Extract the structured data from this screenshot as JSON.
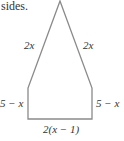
{
  "caption_fragment": "sides.",
  "figure": {
    "shape": "pentagon (triangle atop rectangle)",
    "stroke_color": "#8a8a8a",
    "vertices": [
      [
        60,
        1
      ],
      [
        28,
        88
      ],
      [
        28,
        119
      ],
      [
        92,
        119
      ],
      [
        92,
        88
      ]
    ],
    "labels": {
      "left_slant": "2x",
      "right_slant": "2x",
      "left_vertical": "5 − x",
      "right_vertical": "5 − x",
      "bottom": "2(x − 1)"
    }
  }
}
